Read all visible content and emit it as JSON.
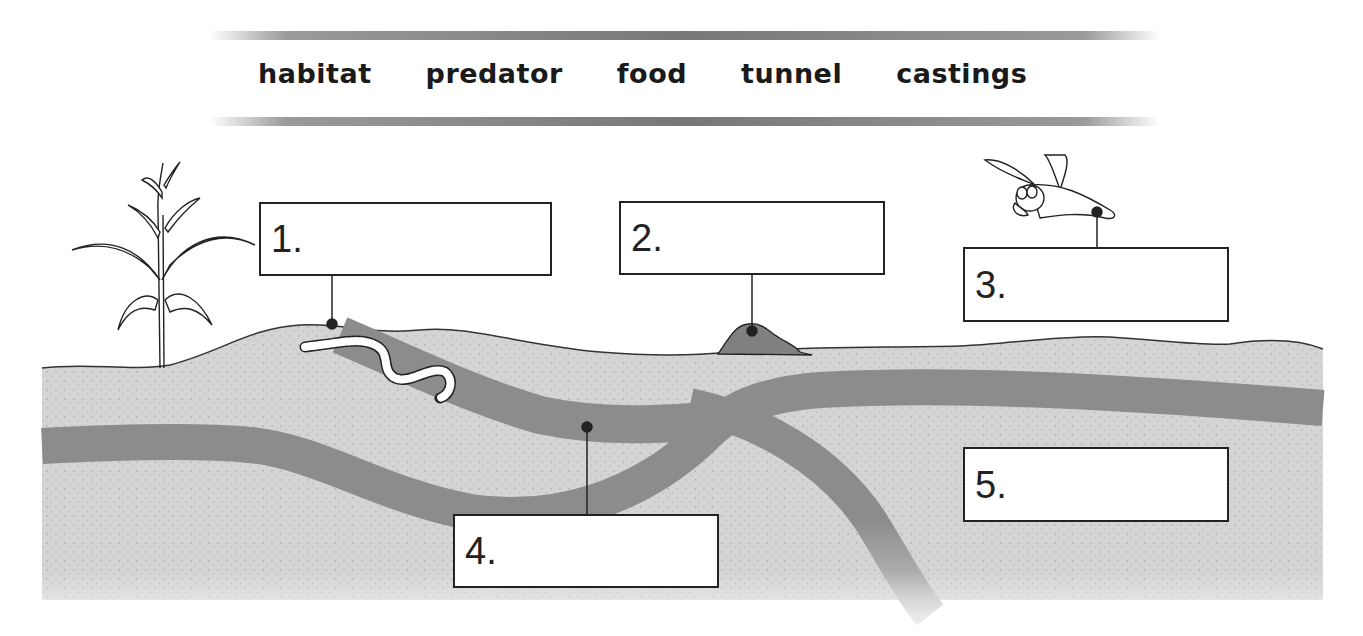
{
  "word_bank": {
    "words": [
      "habitat",
      "predator",
      "food",
      "tunnel",
      "castings"
    ]
  },
  "labels": [
    {
      "number": "1.",
      "target": "worm at surface near plant"
    },
    {
      "number": "2.",
      "target": "mound on surface"
    },
    {
      "number": "3.",
      "target": "bird"
    },
    {
      "number": "4.",
      "target": "underground tunnel"
    },
    {
      "number": "5.",
      "target": "soil"
    }
  ],
  "illustration": {
    "elements": [
      "plant",
      "earthworm",
      "castings-mound",
      "bird",
      "soil",
      "tunnels"
    ],
    "colors": {
      "soil": "#d2d2d2",
      "tunnel": "#8c8c8c",
      "mound": "#7f7f7f",
      "outline": "#222222",
      "bar": "#7a7a7a"
    }
  }
}
